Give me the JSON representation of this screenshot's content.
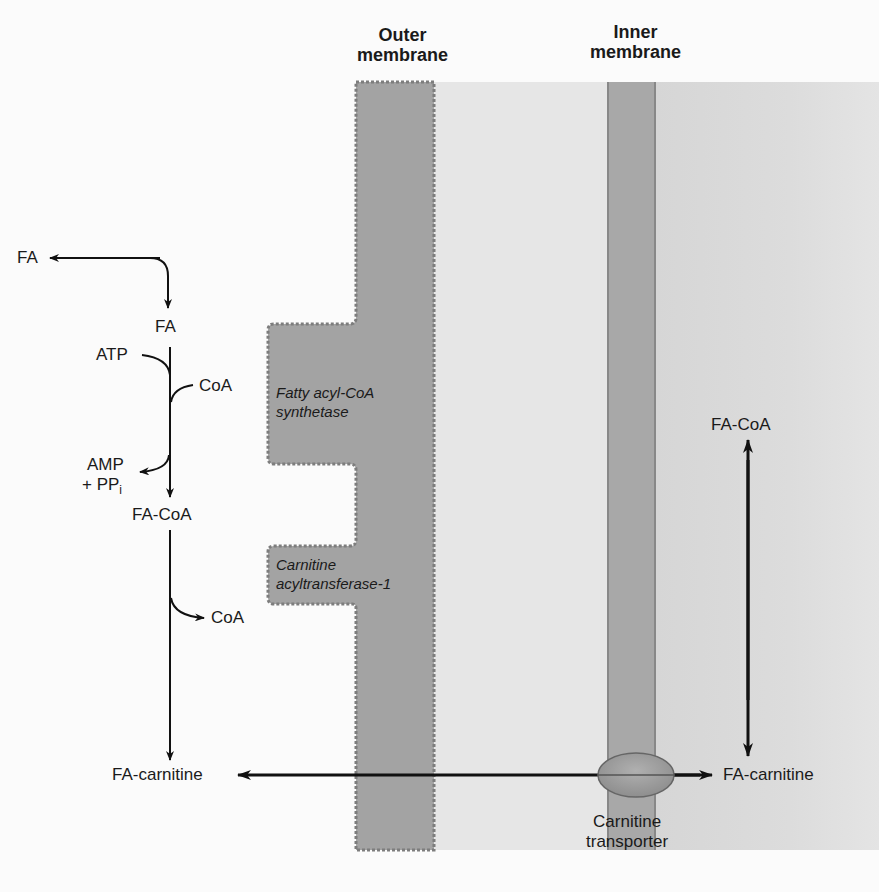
{
  "headers": {
    "outer_membrane": "Outer\nmembrane",
    "outer_line1": "Outer",
    "outer_line2": "membrane",
    "inner_line1": "Inner",
    "inner_line2": "membrane"
  },
  "colors": {
    "outer_membrane": "#a3a3a3",
    "outer_membrane_border": "#7f7f7f",
    "intermembrane_space": "#e6e6e6",
    "inner_membrane": "#a8a8a8",
    "matrix": "#d8d8d8",
    "transporter": "#9a9a9a",
    "arrow": "#111111"
  },
  "cytosol": {
    "fa_top": "FA",
    "fa": "FA",
    "atp": "ATP",
    "coa_in": "CoA",
    "amp": "AMP",
    "ppi_prefix": "+ PP",
    "ppi_sub": "i",
    "fa_coa": "FA-CoA",
    "coa_out": "CoA",
    "fa_carnitine": "FA-carnitine"
  },
  "enzymes": {
    "synthetase_line1": "Fatty acyl-CoA",
    "synthetase_line2": "synthetase",
    "cat1_line1": "Carnitine",
    "cat1_line2": "acyltransferase-1"
  },
  "matrix": {
    "fa_coa": "FA-CoA",
    "fa_carnitine": "FA-carnitine"
  },
  "transporter": {
    "line1": "Carnitine",
    "line2": "transporter"
  }
}
